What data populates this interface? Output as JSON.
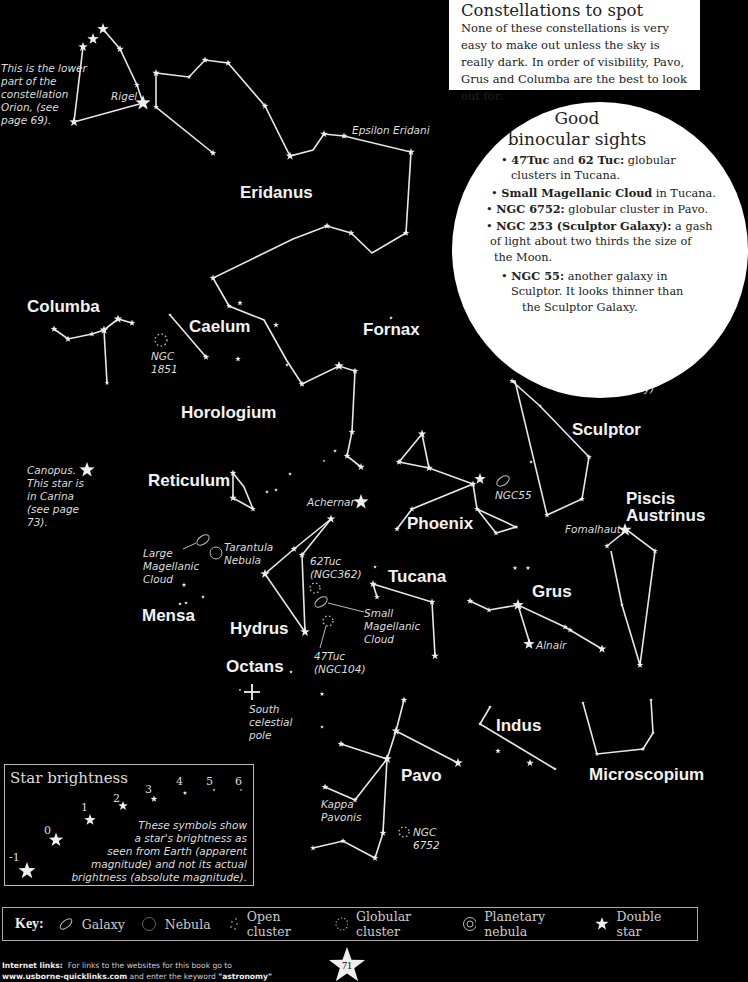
{
  "info_box": {
    "title": "Constellations to spot",
    "body": "None of these constellations is very easy to make out unless the sky is really dark. In order of visibility, Pavo, Grus and Columba are the best to look out for."
  },
  "binocular": {
    "title_line1": "Good",
    "title_line2": "binocular sights",
    "items": [
      {
        "b1": "47Tuc",
        "t1": " and ",
        "b2": "62 Tuc:",
        "t2": " globular",
        "cont": "clusters in Tucana."
      },
      {
        "b1": "Small Magellanic Cloud",
        "t1": " in Tucana."
      },
      {
        "b1": "NGC 6752:",
        "t1": " globular cluster in Pavo."
      },
      {
        "b1": "NGC 253 (Sculptor Galaxy):",
        "t1": " a gash",
        "cont": "of light about two thirds the size of",
        "cont2": "the Moon."
      },
      {
        "b1": "NGC 55:",
        "t1": " another galaxy in",
        "cont": "Sculptor. It looks thinner than",
        "cont2": "the Sculptor Galaxy."
      }
    ]
  },
  "constellations": {
    "eridanus": "Eridanus",
    "columba": "Columba",
    "caelum": "Caelum",
    "fornax": "Fornax",
    "horologium": "Horologium",
    "sculptor": "Sculptor",
    "reticulum": "Reticulum",
    "phoenix": "Phoenix",
    "piscis": "Piscis",
    "austrinus": "Austrinus",
    "tucana": "Tucana",
    "grus": "Grus",
    "mensa": "Mensa",
    "hydrus": "Hydrus",
    "octans": "Octans",
    "indus": "Indus",
    "pavo": "Pavo",
    "microscopium": "Microscopium"
  },
  "notes": {
    "orion": "This is the lower\npart of the\nconstellation\nOrion, (see\npage 69).",
    "rigel": "Rigel",
    "epsilon_eridani": "Epsilon Eridani",
    "ngc1851": "NGC\n1851",
    "canopus": "Canopus.\nThis star is\nin Carina\n(see page\n73).",
    "ngc253": "NGC253\n(Sculptor Galaxy)",
    "ngc55": "NGC55",
    "achernar": "Achernar",
    "fomalhaut": "Fomalhaut",
    "lmc": "Large\nMagellanic\nCloud",
    "tarantula": "Tarantula\nNebula",
    "tuc62": "62Tuc\n(NGC362)",
    "smc": "Small\nMagellanic\nCloud",
    "tuc47": "47Tuc\n(NGC104)",
    "alnair": "Alnair",
    "scp": "South\ncelestial\npole",
    "kappa_pavonis": "Kappa\nPavonis",
    "ngc6752": "NGC\n6752"
  },
  "brightness": {
    "title": "Star brightness",
    "magnitudes": [
      "-1",
      "0",
      "1",
      "2",
      "3",
      "4",
      "5",
      "6"
    ],
    "description": "These symbols show\na star's brightness as\nseen from Earth (apparent\nmagnitude) and not its actual\nbrightness (absolute magnitude)."
  },
  "key": {
    "label": "Key:",
    "items": [
      {
        "icon": "galaxy-icon",
        "label": "Galaxy"
      },
      {
        "icon": "nebula-icon",
        "label": "Nebula"
      },
      {
        "icon": "open-cluster-icon",
        "label": "Open cluster"
      },
      {
        "icon": "globular-cluster-icon",
        "label": "Globular cluster"
      },
      {
        "icon": "planetary-nebula-icon",
        "label": "Planetary nebula"
      },
      {
        "icon": "double-star-icon",
        "label": "Double star"
      }
    ]
  },
  "footer": {
    "links_label": "Internet links:",
    "links_text": "  For links to the websites for this book go to",
    "url": "www.usborne-quicklinks.com",
    "mid": " and enter the keyword ",
    "keyword": "\"astronomy\""
  },
  "page_number": "71"
}
